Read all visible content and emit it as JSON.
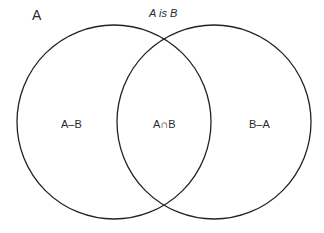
{
  "diagram": {
    "type": "venn",
    "title": "A is B",
    "set_label": "A",
    "regions": {
      "a_minus_b": "A–B",
      "intersection": "A∩B",
      "b_minus_a": "B–A"
    },
    "circles": [
      {
        "name": "A",
        "cx": 114,
        "cy": 122,
        "r": 97
      },
      {
        "name": "B",
        "cx": 214,
        "cy": 122,
        "r": 97
      }
    ],
    "stroke_color": "#222222",
    "background": "#ffffff"
  }
}
